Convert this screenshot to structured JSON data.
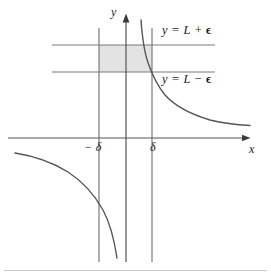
{
  "figure": {
    "background_color": "#ffffff",
    "curve_color": "#555555",
    "axis_color": "#555555",
    "guide_line_color": "#7a7a7a",
    "shade_color": "#e3e3e3",
    "text_color": "#1b1b1b",
    "rule_color": "#cccccc"
  },
  "labels": {
    "upper_bound": "y = L + ϵ",
    "lower_bound": "y = L − ϵ",
    "neg_delta": "− δ",
    "pos_delta": "δ",
    "x_axis": "x",
    "y_axis": "y"
  },
  "chart_data": {
    "type": "line",
    "title": "",
    "xlabel": "x",
    "ylabel": "y",
    "grid": false,
    "legend_position": "inline-right",
    "axes": {
      "x_axis_pixel_y": 138,
      "y_axis_pixel_x": 126,
      "x_axis_start_px": 8,
      "x_axis_end_px": 250,
      "y_axis_top_px": 14,
      "y_axis_bottom_px": 262,
      "x_arrow": true,
      "y_arrow": true
    },
    "tick_labels": {
      "x": [
        "− δ",
        "δ"
      ],
      "y": []
    },
    "annotations": [
      {
        "text": "y = L + ϵ",
        "at_pixel": [
          162,
          24
        ]
      },
      {
        "text": "y = L − ϵ",
        "at_pixel": [
          162,
          73
        ]
      }
    ],
    "guide_lines": [
      {
        "name": "y = L + ϵ",
        "orientation": "horizontal",
        "pixel_y": 45,
        "from_px": 52,
        "to_px": 215
      },
      {
        "name": "y = L − ϵ",
        "orientation": "horizontal",
        "pixel_y": 72,
        "from_px": 52,
        "to_px": 215
      },
      {
        "name": "x = − δ",
        "orientation": "vertical",
        "pixel_x": 99,
        "from_px": 28,
        "to_px": 262
      },
      {
        "name": "x = δ",
        "orientation": "vertical",
        "pixel_x": 152,
        "from_px": 28,
        "to_px": 262
      }
    ],
    "shaded_region": {
      "name": "epsilon-delta box",
      "x_from_px": 99,
      "x_to_px": 152,
      "y_from_px": 45,
      "y_to_px": 72
    },
    "series": [
      {
        "name": "upper-right branch",
        "points_px": [
          [
            141,
            20
          ],
          [
            142,
            28
          ],
          [
            143.5,
            36
          ],
          [
            145,
            45
          ],
          [
            146.5,
            54
          ],
          [
            148.5,
            63
          ],
          [
            151,
            72
          ],
          [
            154,
            81
          ],
          [
            158,
            90
          ],
          [
            163,
            97
          ],
          [
            170,
            103
          ],
          [
            179,
            109
          ],
          [
            190,
            114
          ],
          [
            203,
            118
          ],
          [
            218,
            121
          ],
          [
            234,
            123
          ],
          [
            250,
            125
          ]
        ]
      },
      {
        "name": "lower-left branch",
        "points_px": [
          [
            15,
            153
          ],
          [
            26,
            155
          ],
          [
            38,
            158
          ],
          [
            50,
            162
          ],
          [
            62,
            167
          ],
          [
            74,
            174
          ],
          [
            85,
            183
          ],
          [
            94,
            193
          ],
          [
            101,
            204
          ],
          [
            107,
            216
          ],
          [
            111,
            228
          ],
          [
            114,
            240
          ],
          [
            116,
            250
          ],
          [
            117,
            258
          ]
        ]
      }
    ]
  }
}
